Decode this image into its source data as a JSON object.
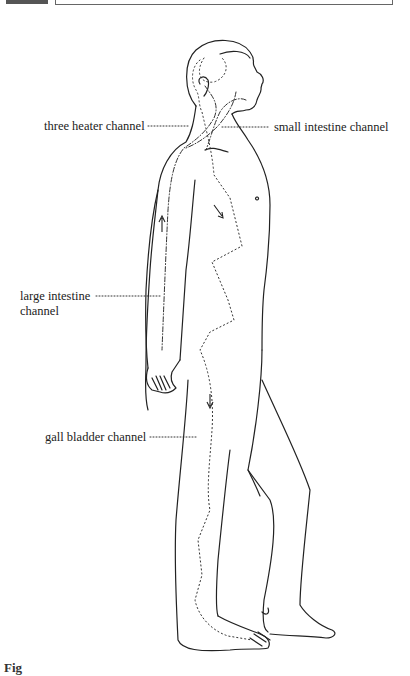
{
  "header": {
    "bar": "",
    "box": ""
  },
  "figure": {
    "line_color": "#222222",
    "background": "#ffffff"
  },
  "labels": {
    "three_heater": "three heater channel",
    "small_intestine": "small intestine channel",
    "large_intestine_line1": "large intestine",
    "large_intestine_line2": "channel",
    "gall_bladder": "gall bladder channel"
  },
  "caption": {
    "text": "Fig"
  }
}
